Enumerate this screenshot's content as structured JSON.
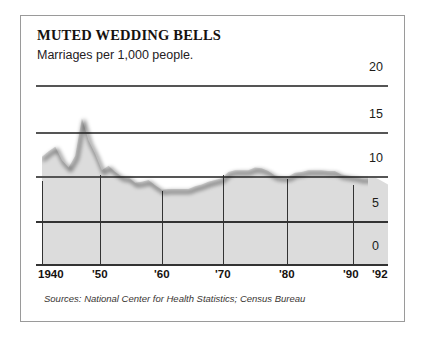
{
  "figure": {
    "title": "MUTED WEDDING BELLS",
    "subtitle": "Marriages per 1,000 people.",
    "source_note": "Sources: National Center for Health Statistics; Census Bureau",
    "frame_color": "#9a9a9a",
    "line_color": "#111111",
    "fill_color": "#dcdcdc",
    "grid_color": "#4a4a4a",
    "text_color": "#16120f"
  },
  "chart_data": {
    "type": "line",
    "title": "MUTED WEDDING BELLS",
    "subtitle": "Marriages per 1,000 people.",
    "xlabel": "",
    "ylabel": "Marriages per 1,000 people",
    "xlim": [
      1940,
      1992
    ],
    "ylim": [
      0,
      20
    ],
    "grid": true,
    "legend": false,
    "area_fill": true,
    "xticks": [
      1940,
      1950,
      1960,
      1970,
      1980,
      1990,
      1992
    ],
    "xticklabels": [
      "1940",
      "'50",
      "'60",
      "'70",
      "'80",
      "'90",
      "'92"
    ],
    "yticks": [
      0,
      5,
      10,
      15,
      20
    ],
    "yticklabels": [
      "0",
      "5",
      "10",
      "15",
      "20"
    ],
    "x": [
      1940,
      1941,
      1942,
      1943,
      1944,
      1945,
      1946,
      1947,
      1948,
      1949,
      1950,
      1951,
      1952,
      1953,
      1954,
      1955,
      1956,
      1957,
      1958,
      1959,
      1960,
      1961,
      1962,
      1963,
      1964,
      1965,
      1966,
      1967,
      1968,
      1969,
      1970,
      1971,
      1972,
      1973,
      1974,
      1975,
      1976,
      1977,
      1978,
      1979,
      1980,
      1981,
      1982,
      1983,
      1984,
      1985,
      1986,
      1987,
      1988,
      1989,
      1990,
      1991,
      1992
    ],
    "series": [
      {
        "name": "Marriages per 1,000 people",
        "values": [
          12.1,
          12.7,
          13.2,
          11.7,
          10.9,
          12.2,
          16.4,
          13.9,
          12.4,
          10.6,
          11.1,
          10.4,
          9.9,
          9.8,
          9.2,
          9.3,
          9.5,
          8.9,
          8.4,
          8.5,
          8.5,
          8.5,
          8.5,
          8.8,
          9.0,
          9.3,
          9.5,
          9.7,
          10.4,
          10.6,
          10.6,
          10.6,
          10.9,
          10.8,
          10.5,
          10.0,
          9.9,
          9.9,
          10.3,
          10.4,
          10.6,
          10.6,
          10.6,
          10.5,
          10.5,
          10.1,
          10.0,
          9.9,
          9.7,
          9.7,
          9.8,
          9.4,
          9.0
        ],
        "color": "#111111",
        "linewidth": 3.0
      }
    ]
  },
  "axes": {
    "y_ticks": [
      {
        "label": "20",
        "value": 20
      },
      {
        "label": "15",
        "value": 15
      },
      {
        "label": "10",
        "value": 10
      },
      {
        "label": "5",
        "value": 5
      },
      {
        "label": "0",
        "value": 0
      }
    ],
    "x_ticks": [
      {
        "label": "1940",
        "value": 1940
      },
      {
        "label": "'50",
        "value": 1950
      },
      {
        "label": "'60",
        "value": 1960
      },
      {
        "label": "'70",
        "value": 1970
      },
      {
        "label": "'80",
        "value": 1980
      },
      {
        "label": "'90",
        "value": 1990
      },
      {
        "label": "'92",
        "value": 1992
      }
    ]
  }
}
